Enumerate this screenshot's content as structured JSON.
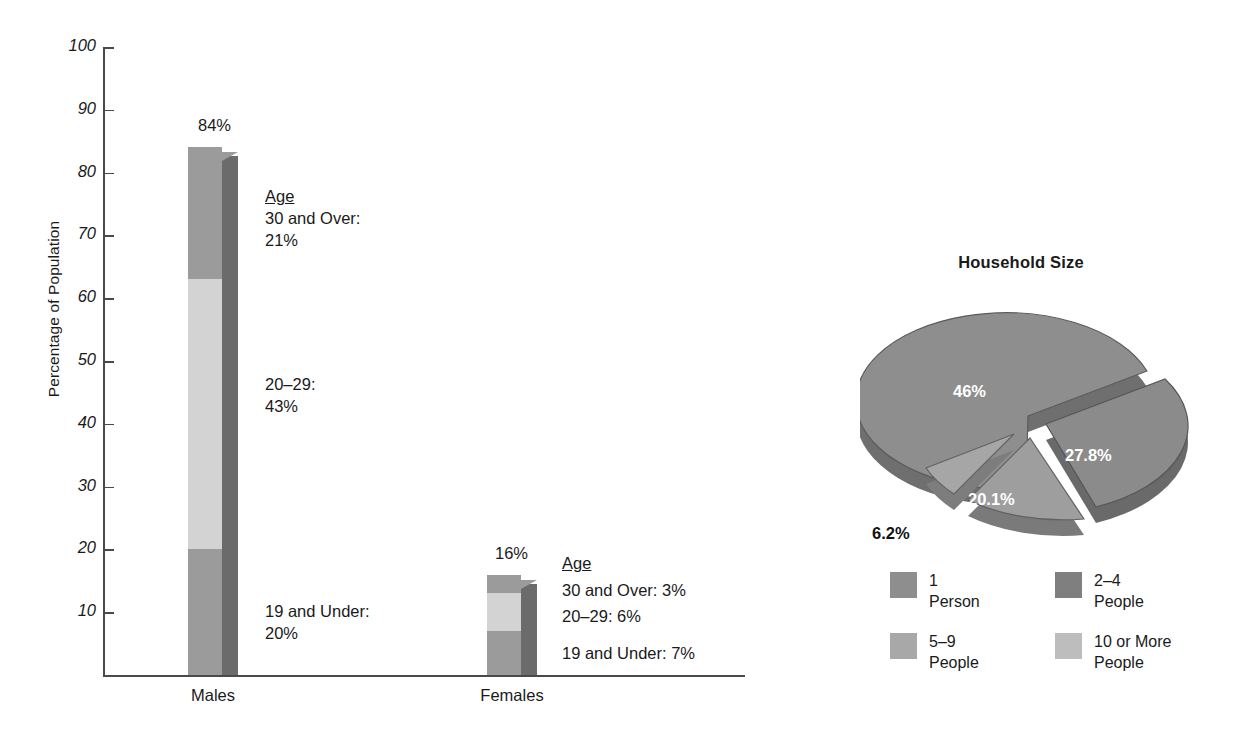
{
  "chart_data": [
    {
      "type": "bar",
      "subtype": "stacked-3d-column",
      "title": "",
      "xlabel": "",
      "ylabel": "Percentage of Population",
      "ylim": [
        0,
        100
      ],
      "ytick_labels": [
        "10",
        "20",
        "30",
        "40",
        "50",
        "60",
        "70",
        "80",
        "90",
        "100"
      ],
      "ytick_values": [
        10,
        20,
        30,
        40,
        50,
        60,
        70,
        80,
        90,
        100
      ],
      "grid": false,
      "categories": [
        "Males",
        "Females"
      ],
      "totals": [
        84,
        16
      ],
      "total_labels": [
        "84%",
        "16%"
      ],
      "series": [
        {
          "name": "19 and Under",
          "values": [
            20,
            7
          ],
          "color": "#9b9b9b"
        },
        {
          "name": "20-29",
          "values": [
            43,
            6
          ],
          "color": "#d3d3d3"
        },
        {
          "name": "30 and Over",
          "values": [
            21,
            3
          ],
          "color": "#9b9b9b"
        }
      ],
      "annotations": {
        "males": {
          "header": "Age",
          "lines": [
            {
              "label": "30 and Over:",
              "value": "21%"
            },
            {
              "label": "20–29:",
              "value": "43%"
            },
            {
              "label": "19 and Under:",
              "value": "20%"
            }
          ]
        },
        "females": {
          "header": "Age",
          "lines": [
            {
              "label": "30 and Over: 3%"
            },
            {
              "label": "20–29: 6%"
            },
            {
              "label": "19 and Under: 7%"
            }
          ]
        }
      }
    },
    {
      "type": "pie",
      "subtype": "exploded-3d",
      "title": "Household Size",
      "labels": [
        "2–4 People",
        "1 Person",
        "5–9 People",
        "10 or More People"
      ],
      "values": [
        46,
        27.8,
        20.1,
        6.2
      ],
      "value_labels": [
        "46%",
        "27.8%",
        "20.1%",
        "6.2%"
      ],
      "legend_position": "bottom",
      "legend": [
        {
          "label": "1\nPerson",
          "color": "#8e8e8e"
        },
        {
          "label": "2–4\nPeople",
          "color": "#7f7f7f"
        },
        {
          "label": "5–9\nPeople",
          "color": "#a8a8a8"
        },
        {
          "label": "10 or More\nPeople",
          "color": "#bdbdbd"
        }
      ]
    }
  ],
  "bar_chart": {
    "y_axis_title": "Percentage of Population",
    "ticks": [
      {
        "label": "100",
        "value": 100
      },
      {
        "label": "90",
        "value": 90
      },
      {
        "label": "80",
        "value": 80
      },
      {
        "label": "70",
        "value": 70
      },
      {
        "label": "60",
        "value": 60
      },
      {
        "label": "50",
        "value": 50
      },
      {
        "label": "40",
        "value": 40
      },
      {
        "label": "30",
        "value": 30
      },
      {
        "label": "20",
        "value": 20
      },
      {
        "label": "10",
        "value": 10
      }
    ],
    "males": {
      "category": "Males",
      "total_label": "84%",
      "annot_header": "Age",
      "annot_top_label": "30 and Over:",
      "annot_top_value": "21%",
      "annot_mid_label": "20–29:",
      "annot_mid_value": "43%",
      "annot_bot_label": "19 and Under:",
      "annot_bot_value": "20%"
    },
    "females": {
      "category": "Females",
      "total_label": "16%",
      "annot_header": "Age",
      "annot_top": "30 and Over: 3%",
      "annot_mid": "20–29: 6%",
      "annot_bot": "19 and Under: 7%"
    }
  },
  "pie_chart": {
    "title": "Household Size",
    "slice_labels": {
      "large": "46%",
      "right": "27.8%",
      "bottom": "20.1%",
      "small": "6.2%"
    },
    "legend": [
      {
        "label": "1\nPerson"
      },
      {
        "label": "2–4\nPeople"
      },
      {
        "label": "5–9\nPeople"
      },
      {
        "label": "10 or More\nPeople"
      }
    ]
  },
  "colors": {
    "seg_dark": "#9b9b9b",
    "seg_light": "#d3d3d3",
    "bar_side": "#6b6b6b",
    "pie_top_a": "#8e8e8e",
    "pie_top_b": "#9d9d9d",
    "pie_top_c": "#a8a8a8",
    "pie_top_d": "#b5b5b5",
    "axis": "#4a4a4a"
  }
}
